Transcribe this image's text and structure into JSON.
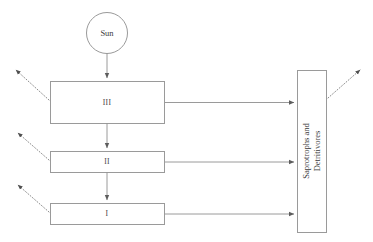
{
  "diagram": {
    "colors": {
      "stroke": "#9a9a9a",
      "arrow": "#8f8f8f",
      "dotted": "#7d7d7d",
      "text": "#3c3c3c",
      "background": "#ffffff"
    },
    "source": {
      "label": "Sun",
      "shape": "circle"
    },
    "trophic_levels": [
      {
        "label": "III",
        "name": "trophic-level-three"
      },
      {
        "label": "II",
        "name": "trophic-level-two"
      },
      {
        "label": "I",
        "name": "trophic-level-one"
      }
    ],
    "decomposer": {
      "line1": "Saprotrophs and",
      "line2": "Detritivores"
    },
    "arrows": {
      "sun_to_level": "solid-down",
      "level_to_level": "solid-down",
      "level_to_decomposer": "solid-right",
      "energy_loss": "dotted-diagonal"
    }
  }
}
